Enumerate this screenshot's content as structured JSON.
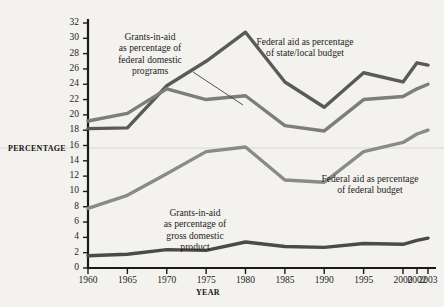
{
  "figure": {
    "background_color": "#f3f2ee",
    "axis_color": "#1a1a1a",
    "text_color": "#1d1d1d"
  },
  "axis_titles": {
    "y_label": "PERCENTAGE",
    "x_label": "YEAR"
  },
  "annotations": [
    {
      "name": "annotation-federal-domestic-programs",
      "text": "Grants-in-aid\nas percentage of\nfederal domestic\nprograms",
      "leader_line": true
    },
    {
      "name": "annotation-state-local-budget",
      "text": "Federal aid as percentage\nof state/local budget",
      "leader_line": false
    },
    {
      "name": "annotation-federal-budget",
      "text": "Federal aid as percentage\nof federal budget",
      "leader_line": false
    },
    {
      "name": "annotation-gross-domestic-product",
      "text": "Grants-in-aid\nas percentage of\ngross domestic\nproduct",
      "leader_line": false
    }
  ],
  "chart_data": {
    "type": "line",
    "title": "",
    "xlabel": "YEAR",
    "ylabel": "PERCENTAGE",
    "x": [
      1960,
      1965,
      1970,
      1975,
      1980,
      1985,
      1990,
      1995,
      2000,
      2002,
      2003
    ],
    "xtick_labels": [
      "1960",
      "1965",
      "1970",
      "1975",
      "1980",
      "1985",
      "1990",
      "1995",
      "2000",
      "2002",
      "2003"
    ],
    "ytick_labels": [
      "0",
      "2",
      "4",
      "6",
      "8",
      "10",
      "12",
      "14",
      "16",
      "18",
      "20",
      "22",
      "24",
      "26",
      "28",
      "30",
      "32"
    ],
    "ytick_values": [
      0,
      2,
      4,
      6,
      8,
      10,
      12,
      14,
      16,
      18,
      20,
      22,
      24,
      26,
      28,
      30,
      32
    ],
    "ylim": [
      0,
      32
    ],
    "grid": false,
    "legend_position": "inline-annotations",
    "series": [
      {
        "name": "Federal aid as percentage of state/local budget",
        "color": "#5a5a5a",
        "values": [
          18.2,
          18.3,
          23.8,
          27.0,
          30.8,
          24.3,
          21.0,
          25.5,
          24.3,
          26.8,
          26.5
        ]
      },
      {
        "name": "Grants-in-aid as percentage of federal domestic programs",
        "color": "#7d7d7d",
        "values": [
          19.2,
          20.2,
          23.4,
          22.0,
          22.5,
          18.6,
          17.9,
          22.0,
          22.4,
          23.4,
          24.0
        ]
      },
      {
        "name": "Federal aid as percentage of federal budget",
        "color": "#8a8a8a",
        "values": [
          7.8,
          9.5,
          12.3,
          15.2,
          15.8,
          11.5,
          11.2,
          15.2,
          16.4,
          17.5,
          18.0
        ]
      },
      {
        "name": "Grants-in-aid as percentage of gross domestic product",
        "color": "#4a4a4a",
        "values": [
          1.6,
          1.8,
          2.4,
          2.3,
          3.4,
          2.8,
          2.7,
          3.2,
          3.1,
          3.6,
          3.9
        ]
      }
    ]
  }
}
